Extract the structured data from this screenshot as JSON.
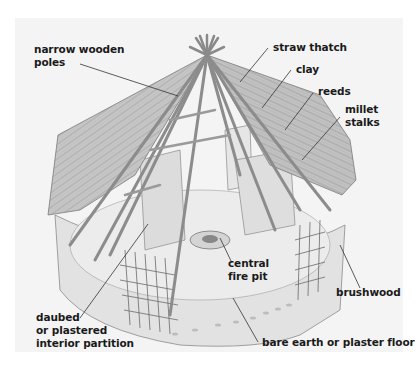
{
  "diagram": {
    "background_color": "#f4f4f4",
    "label_color": "#1a1a1a",
    "labels": [
      {
        "id": "narrow-wooden-poles",
        "lines": [
          "narrow wooden",
          "poles"
        ]
      },
      {
        "id": "straw-thatch",
        "lines": [
          "straw thatch"
        ]
      },
      {
        "id": "clay",
        "lines": [
          "clay"
        ]
      },
      {
        "id": "reeds",
        "lines": [
          "reeds"
        ]
      },
      {
        "id": "millet-stalks",
        "lines": [
          "millet",
          "stalks"
        ]
      },
      {
        "id": "central-fire-pit",
        "lines": [
          "central",
          "fire pit"
        ]
      },
      {
        "id": "brushwood",
        "lines": [
          "brushwood"
        ]
      },
      {
        "id": "daubed-partition",
        "lines": [
          "daubed",
          "or plastered",
          "interior partition"
        ]
      },
      {
        "id": "floor",
        "lines": [
          "bare earth or plaster floor"
        ]
      }
    ]
  }
}
